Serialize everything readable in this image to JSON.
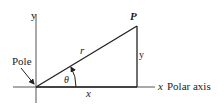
{
  "diagram": {
    "labels": {
      "y_axis": "y",
      "x_axis": "x",
      "polar_axis": "Polar axis",
      "pole": "Pole",
      "point": "P",
      "radius": "r",
      "angle": "θ",
      "x_leg": "x",
      "y_leg": "y"
    },
    "colors": {
      "line": "#222222",
      "axis": "#555555",
      "background": "#ffffff"
    }
  }
}
